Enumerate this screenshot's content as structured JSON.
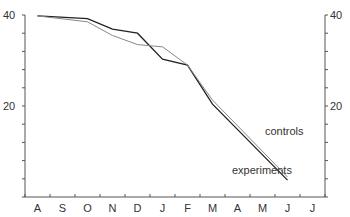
{
  "chart_data": {
    "type": "line",
    "title": "",
    "xlabel": "",
    "ylabel": "",
    "categories": [
      "A",
      "S",
      "O",
      "N",
      "D",
      "J",
      "F",
      "M",
      "A",
      "M",
      "J",
      "J"
    ],
    "y_ticks_labeled": [
      20,
      40
    ],
    "ylim": [
      0,
      40
    ],
    "y_tick_interval": 4,
    "grid": false,
    "dual_y_axis": true,
    "series": [
      {
        "name": "experiments",
        "color": "#222222",
        "points": [
          {
            "x": "A",
            "y": 39.8
          },
          {
            "x": "O",
            "y": 39.2
          },
          {
            "x": "N",
            "y": 36.9
          },
          {
            "x": "D",
            "y": 36.0
          },
          {
            "x": "J",
            "y": 30.3
          },
          {
            "x": "F",
            "y": 29.0
          },
          {
            "x": "M",
            "y": 20.4
          },
          {
            "x": "J",
            "y": 3.7
          }
        ]
      },
      {
        "name": "controls",
        "color": "#888888",
        "points": [
          {
            "x": "A",
            "y": 39.8
          },
          {
            "x": "O",
            "y": 38.5
          },
          {
            "x": "N",
            "y": 35.5
          },
          {
            "x": "D",
            "y": 33.5
          },
          {
            "x": "J",
            "y": 33.0
          },
          {
            "x": "F",
            "y": 29.0
          },
          {
            "x": "M",
            "y": 21.3
          },
          {
            "x": "J",
            "y": 4.4
          }
        ]
      }
    ],
    "annotations": [
      {
        "text": "controls",
        "near": "M-J controls line"
      },
      {
        "text": "experiments",
        "near": "M-J experiments line"
      }
    ]
  },
  "labels": {
    "y_top": "40",
    "y_mid": "20",
    "controls": "controls",
    "experiments": "experiments"
  }
}
